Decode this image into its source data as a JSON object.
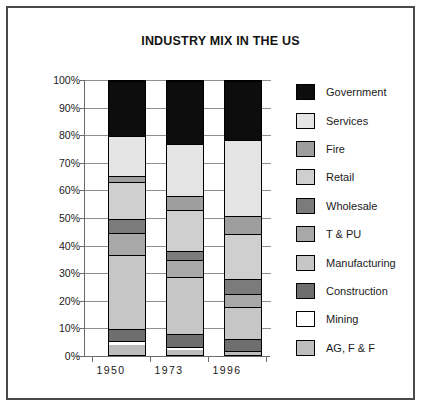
{
  "chart_data": {
    "type": "bar",
    "subtype": "stacked-percent",
    "title": "INDUSTRY MIX IN THE US",
    "xlabel": "",
    "ylabel": "",
    "categories": [
      "1950",
      "1973",
      "1996"
    ],
    "ylim": [
      0,
      100
    ],
    "ytick_labels": [
      "0%",
      "10%",
      "20%",
      "30%",
      "40%",
      "50%",
      "60%",
      "70%",
      "80%",
      "90%",
      "100%"
    ],
    "ytick_values": [
      0,
      10,
      20,
      30,
      40,
      50,
      60,
      70,
      80,
      90,
      100
    ],
    "grid": true,
    "legend_position": "right",
    "stack_order_bottom_to_top": [
      "AG, F & F",
      "Mining",
      "Construction",
      "Manufacturing",
      "T & PU",
      "Wholesale",
      "Retail",
      "Fire",
      "Services",
      "Government"
    ],
    "series": [
      {
        "name": "Government",
        "color": "#0d0d0d",
        "values": [
          20.0,
          23.0,
          21.5
        ]
      },
      {
        "name": "Services",
        "color": "#e4e4e4",
        "values": [
          14.5,
          19.0,
          28.0
        ]
      },
      {
        "name": "Fire",
        "color": "#9e9e9e",
        "values": [
          2.5,
          5.0,
          6.5
        ]
      },
      {
        "name": "Retail",
        "color": "#cfcfcf",
        "values": [
          13.5,
          15.0,
          16.5
        ]
      },
      {
        "name": "Wholesale",
        "color": "#7b7b7b",
        "values": [
          5.0,
          3.5,
          5.5
        ]
      },
      {
        "name": "T & PU",
        "color": "#a8a8a8",
        "values": [
          8.0,
          6.0,
          5.0
        ]
      },
      {
        "name": "Manufacturing",
        "color": "#c6c6c6",
        "values": [
          27.0,
          21.0,
          11.5
        ]
      },
      {
        "name": "Construction",
        "color": "#6e6e6e",
        "values": [
          4.5,
          4.5,
          4.5
        ]
      },
      {
        "name": "Mining",
        "color": "#ffffff",
        "values": [
          1.5,
          1.0,
          0.5
        ]
      },
      {
        "name": "AG, F & F",
        "color": "#bdbdbd",
        "values": [
          3.5,
          2.0,
          1.0
        ]
      }
    ]
  },
  "legend": {
    "items": [
      {
        "label": "Government",
        "color": "#0d0d0d"
      },
      {
        "label": "Services",
        "color": "#e4e4e4"
      },
      {
        "label": "Fire",
        "color": "#9e9e9e"
      },
      {
        "label": "Retail",
        "color": "#cfcfcf"
      },
      {
        "label": "Wholesale",
        "color": "#7b7b7b"
      },
      {
        "label": "T & PU",
        "color": "#a8a8a8"
      },
      {
        "label": "Manufacturing",
        "color": "#c6c6c6"
      },
      {
        "label": "Construction",
        "color": "#6e6e6e"
      },
      {
        "label": "Mining",
        "color": "#ffffff"
      },
      {
        "label": "AG, F & F",
        "color": "#bdbdbd"
      }
    ]
  },
  "style": {
    "frame_border": "#4a4a4a",
    "gridline": "#8f8f8f",
    "axis": "#6b6b6b",
    "text": "#1a1a1a"
  }
}
